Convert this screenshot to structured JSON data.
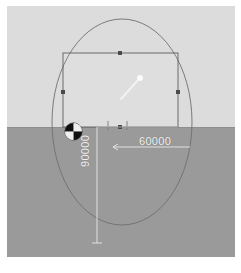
{
  "app": {
    "type": "cad-viewport",
    "view_mode": "perspective-3d"
  },
  "viewport": {
    "sky_color": "#dcdcdc",
    "ground_color": "#9a9a9a",
    "horizon_color": "#8e8e8e",
    "frame_background": "#ffffff"
  },
  "geometry": {
    "ellipse": {
      "name": "ellipse-outline",
      "cx": 115,
      "cy": 116,
      "rx": 70,
      "ry": 103,
      "stroke": "#6f6f6f"
    },
    "rectangle": {
      "name": "selected-rectangle",
      "x": 56,
      "y": 47,
      "width": 115,
      "height": 74,
      "stroke": "#5e5e5e"
    },
    "handles": [
      {
        "name": "handle-top-middle",
        "x": 113,
        "y": 47
      },
      {
        "name": "handle-left-middle",
        "x": 56,
        "y": 86
      },
      {
        "name": "handle-right-middle",
        "x": 171,
        "y": 86
      },
      {
        "name": "handle-bottom-middle",
        "x": 113,
        "y": 121
      }
    ]
  },
  "dimensions": {
    "width": {
      "label": "60000",
      "orientation": "horizontal",
      "color": "#f2f2f2"
    },
    "height": {
      "label": "90000",
      "orientation": "vertical",
      "color": "#f2f2f2"
    },
    "leader_color": "#e8e8e8"
  },
  "gizmo": {
    "name": "rotation-gizmo",
    "style": "quadrant-circle",
    "dark_color": "#111111",
    "light_color": "#f0f0f0"
  },
  "cursor": {
    "name": "pointer-cursor",
    "color": "#f5f5f5"
  }
}
